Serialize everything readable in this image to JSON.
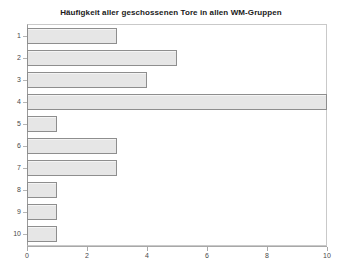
{
  "chart_data": {
    "type": "bar",
    "orientation": "horizontal",
    "title": "Häufigkeit aller geschossenen Tore in allen WM-Gruppen",
    "xlabel": "",
    "ylabel": "",
    "categories": [
      "1",
      "2",
      "3",
      "4",
      "5",
      "6",
      "7",
      "8",
      "9",
      "10"
    ],
    "values": [
      3,
      5,
      4,
      10,
      1,
      3,
      3,
      1,
      1,
      1
    ],
    "xlim": [
      0,
      10
    ],
    "xticks": [
      0,
      2,
      4,
      6,
      8,
      10
    ],
    "xtick_labels": [
      "0",
      "2",
      "4",
      "6",
      "8",
      "10"
    ],
    "grid": false,
    "legend": "none",
    "series": [
      {
        "name": "Häufigkeit",
        "values": [
          3,
          5,
          4,
          10,
          1,
          3,
          3,
          1,
          1,
          1
        ]
      }
    ],
    "colors": {
      "bar_fill": "#e6e6e6",
      "bar_stroke": "#8e8e8e",
      "plot_background": "#ffffff",
      "frame": "#c9c9c9",
      "axis": "#a8a8a8",
      "title_text": "#1a1a1a",
      "tick_text": "#4a4a4a"
    }
  }
}
